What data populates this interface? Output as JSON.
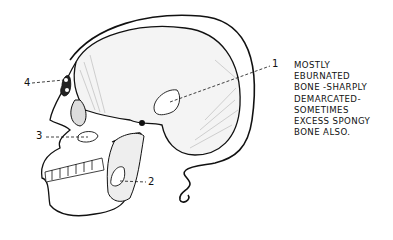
{
  "figure": {
    "markers": [
      {
        "id": "1",
        "label": "1",
        "region": "temporal/parietal lesion"
      },
      {
        "id": "2",
        "label": "2",
        "region": "mandibular ramus lesion"
      },
      {
        "id": "3",
        "label": "3",
        "region": "maxillary lesion"
      },
      {
        "id": "4",
        "label": "4",
        "region": "frontal sinus / orbital lesion"
      }
    ]
  },
  "caption": {
    "lines": [
      "MOSTLY",
      "EBURNATED",
      "BONE -SHARPLY",
      "DEMARCATED-",
      "SOMETIMES",
      "EXCESS SPONGY",
      "BONE ALSO."
    ]
  },
  "colors": {
    "ink": "#111111",
    "background": "#ffffff"
  }
}
